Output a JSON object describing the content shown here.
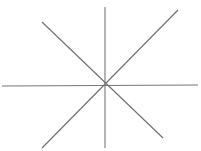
{
  "figure": {
    "name": "eight-spoke-asterisk",
    "canvas": {
      "width": 201,
      "height": 151,
      "background_color": "#ffffff"
    },
    "center": {
      "x": 105,
      "y": 86
    },
    "stroke": {
      "color": "#6e6e6e",
      "width": 1.1,
      "opacity": 1
    },
    "line_count": 4,
    "spoke_count": 8,
    "lines": [
      {
        "id": "horizontal",
        "label": "Horizontal line",
        "x1": 2,
        "y1": 86,
        "x2": 198,
        "y2": 85,
        "color": "#777777",
        "width": 1.1
      },
      {
        "id": "vertical",
        "label": "Vertical line",
        "x1": 105,
        "y1": 7,
        "x2": 105,
        "y2": 148,
        "color": "#777777",
        "width": 1.1
      },
      {
        "id": "diagonal-nwse",
        "label": "Diagonal line from upper left to lower right",
        "x1": 42,
        "y1": 22,
        "x2": 163,
        "y2": 138,
        "color": "#6e6e6e",
        "width": 1.1
      },
      {
        "id": "diagonal-swne",
        "label": "Diagonal line from lower left to upper right",
        "x1": 42,
        "y1": 148,
        "x2": 178,
        "y2": 10,
        "color": "#6e6e6e",
        "width": 1.1
      }
    ]
  }
}
